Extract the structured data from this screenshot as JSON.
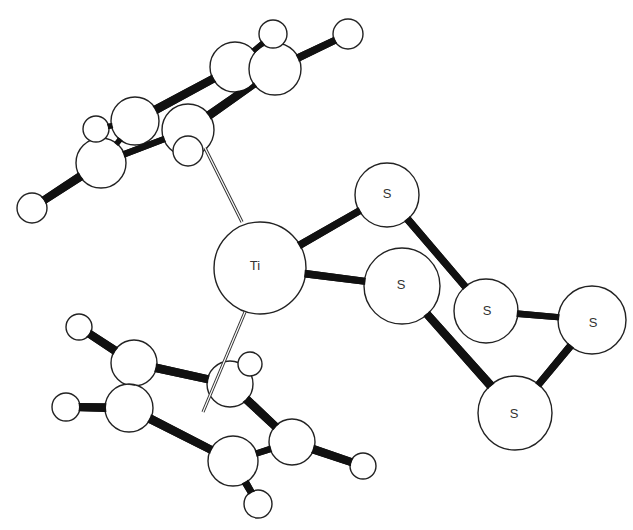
{
  "diagram": {
    "type": "ball-and-stick molecular structure",
    "molecule": "Cp2TiS5 (bis(cyclopentadienyl)titanium pentasulfide)",
    "colors": {
      "background": "#ffffff",
      "atom_fill": "#ffffff",
      "outline": "#222222",
      "bond": "#111111"
    },
    "labels": {
      "ti": "Ti",
      "s1": "S",
      "s2": "S",
      "s3": "S",
      "s4": "S",
      "s5": "S"
    },
    "atoms": [
      {
        "id": "Ti",
        "element": "Ti",
        "x": 260,
        "y": 268,
        "r": 46
      },
      {
        "id": "S1",
        "element": "S",
        "x": 387,
        "y": 195,
        "r": 32
      },
      {
        "id": "S2",
        "element": "S",
        "x": 402,
        "y": 286,
        "r": 38
      },
      {
        "id": "S3",
        "element": "S",
        "x": 486,
        "y": 311,
        "r": 32
      },
      {
        "id": "S4",
        "element": "S",
        "x": 592,
        "y": 320,
        "r": 34
      },
      {
        "id": "S5",
        "element": "S",
        "x": 515,
        "y": 413,
        "r": 37
      },
      {
        "id": "C1",
        "element": "C",
        "x": 235,
        "y": 67,
        "r": 25
      },
      {
        "id": "C2",
        "element": "C",
        "x": 275,
        "y": 69,
        "r": 26
      },
      {
        "id": "C3",
        "element": "C",
        "x": 135,
        "y": 121,
        "r": 24
      },
      {
        "id": "C4",
        "element": "C",
        "x": 188,
        "y": 130,
        "r": 26
      },
      {
        "id": "C5",
        "element": "C",
        "x": 101,
        "y": 163,
        "r": 25
      },
      {
        "id": "C6",
        "element": "C",
        "x": 134,
        "y": 363,
        "r": 23
      },
      {
        "id": "C7",
        "element": "C",
        "x": 129,
        "y": 408,
        "r": 24
      },
      {
        "id": "C8",
        "element": "C",
        "x": 230,
        "y": 384,
        "r": 23
      },
      {
        "id": "C9",
        "element": "C",
        "x": 292,
        "y": 442,
        "r": 23
      },
      {
        "id": "C10",
        "element": "C",
        "x": 233,
        "y": 461,
        "r": 25
      },
      {
        "id": "H1",
        "element": "H",
        "x": 273,
        "y": 34,
        "r": 14
      },
      {
        "id": "H2",
        "element": "H",
        "x": 348,
        "y": 34,
        "r": 15
      },
      {
        "id": "H3",
        "element": "H",
        "x": 96,
        "y": 129,
        "r": 13
      },
      {
        "id": "H4",
        "element": "H",
        "x": 188,
        "y": 151,
        "r": 15
      },
      {
        "id": "H5",
        "element": "H",
        "x": 32,
        "y": 208,
        "r": 15
      },
      {
        "id": "H6",
        "element": "H",
        "x": 79,
        "y": 327,
        "r": 13
      },
      {
        "id": "H7",
        "element": "H",
        "x": 66,
        "y": 407,
        "r": 14
      },
      {
        "id": "H8",
        "element": "H",
        "x": 250,
        "y": 364,
        "r": 12
      },
      {
        "id": "H9",
        "element": "H",
        "x": 363,
        "y": 466,
        "r": 13
      },
      {
        "id": "H10",
        "element": "H",
        "x": 258,
        "y": 504,
        "r": 14
      }
    ],
    "bonds": [
      {
        "a": "Ti",
        "b": "S1",
        "w": 7
      },
      {
        "a": "Ti",
        "b": "S2",
        "w": 7
      },
      {
        "a": "S1",
        "b": "S3",
        "w": 7
      },
      {
        "a": "S3",
        "b": "S4",
        "w": 6
      },
      {
        "a": "S4",
        "b": "S5",
        "w": 7
      },
      {
        "a": "S5",
        "b": "S2",
        "w": 8
      },
      {
        "a": "C3",
        "b": "C1",
        "w": 8
      },
      {
        "a": "C4",
        "b": "C2",
        "w": 8
      },
      {
        "a": "C1",
        "b": "C2",
        "w": 5
      },
      {
        "a": "C5",
        "b": "C4",
        "w": 6
      },
      {
        "a": "C3",
        "b": "C5",
        "w": 5
      },
      {
        "a": "C5",
        "b": "H5",
        "w": 8
      },
      {
        "a": "C2",
        "b": "H2",
        "w": 7
      },
      {
        "a": "C1",
        "b": "H1",
        "w": 5
      },
      {
        "a": "C3",
        "b": "H3",
        "w": 5
      },
      {
        "a": "C6",
        "b": "C8",
        "w": 8
      },
      {
        "a": "C7",
        "b": "C10",
        "w": 8
      },
      {
        "a": "C6",
        "b": "C7",
        "w": 6
      },
      {
        "a": "C8",
        "b": "C9",
        "w": 8
      },
      {
        "a": "C9",
        "b": "C10",
        "w": 6
      },
      {
        "a": "C6",
        "b": "H6",
        "w": 8
      },
      {
        "a": "C7",
        "b": "H7",
        "w": 8
      },
      {
        "a": "C9",
        "b": "H9",
        "w": 8
      },
      {
        "a": "C10",
        "b": "H10",
        "w": 7
      }
    ],
    "centroid_links": [
      {
        "x1": 205,
        "y1": 148,
        "x2": 242,
        "y2": 222
      },
      {
        "x1": 245,
        "y1": 312,
        "x2": 203,
        "y2": 412
      }
    ]
  }
}
